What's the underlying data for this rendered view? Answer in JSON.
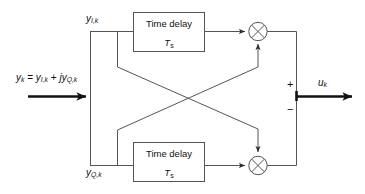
{
  "diagram": {
    "type": "block-diagram",
    "background_color": "#ffffff",
    "line_color": "#555555",
    "bold_line_color": "#111111",
    "text_color": "#111111"
  },
  "input": {
    "equation_y": "y",
    "equation_sub_k": "k",
    "equation_eq": " = ",
    "equation_y2": "y",
    "equation_sub_ik": "I,k",
    "equation_plus": " + ",
    "equation_j": "j",
    "equation_y3": "y",
    "equation_sub_qk": "Q,k",
    "arrow_name": "input-arrow"
  },
  "branches": {
    "upper_label_y": "y",
    "upper_label_sub": "I,k",
    "lower_label_y": "y",
    "lower_label_sub": "Q,k"
  },
  "blocks": [
    {
      "id": "time-delay-upper",
      "title": "Time delay",
      "symbol": "T",
      "symbol_sub": "s"
    },
    {
      "id": "time-delay-lower",
      "title": "Time delay",
      "symbol": "T",
      "symbol_sub": "s"
    }
  ],
  "multipliers": [
    {
      "id": "multiplier-upper",
      "glyph": "x"
    },
    {
      "id": "multiplier-lower",
      "glyph": "x"
    }
  ],
  "summing": {
    "plus_sign": "+",
    "minus_sign": "−"
  },
  "output": {
    "label_u": "u",
    "label_sub": "k",
    "arrow_name": "output-arrow"
  }
}
